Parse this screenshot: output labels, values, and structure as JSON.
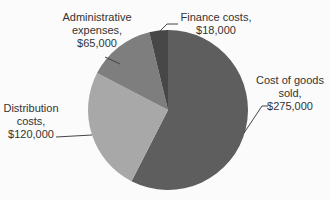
{
  "chart_data": {
    "type": "pie",
    "title": "",
    "categories": [
      "Cost of goods sold",
      "Distribution costs",
      "Administrative expenses",
      "Finance costs"
    ],
    "values": [
      275000,
      120000,
      65000,
      18000
    ],
    "colors": [
      "#5e5e5e",
      "#a8a8a8",
      "#7e7e7e",
      "#474747"
    ],
    "labels": [
      "Cost of goods sold, $275,000",
      "Distribution costs, $120,000",
      "Administrative expenses, $65,000",
      "Finance costs, $18,000"
    ]
  },
  "labels": {
    "cogs": [
      "Cost of goods",
      "sold,",
      "$275,000"
    ],
    "dist": [
      "Distribution",
      "costs,",
      "$120,000"
    ],
    "admin": [
      "Administrative",
      "expenses,",
      "$65,000"
    ],
    "fin": [
      "Finance costs,",
      "$18,000"
    ]
  }
}
